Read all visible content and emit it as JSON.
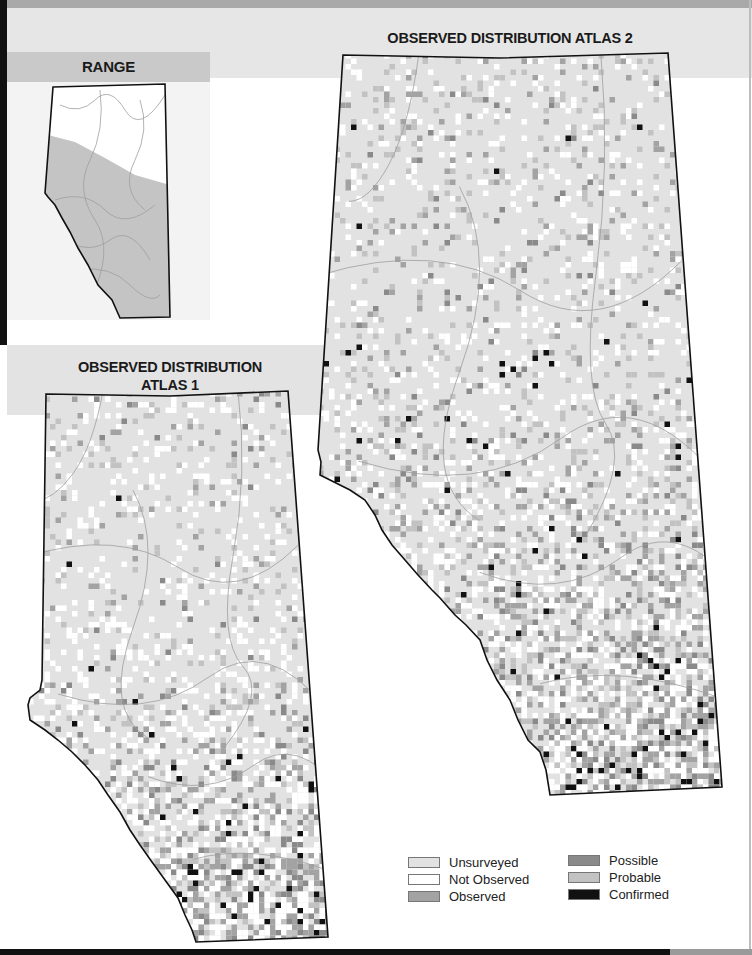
{
  "titles": {
    "range": "RANGE",
    "atlas2": "OBSERVED DISTRIBUTION ATLAS 2",
    "atlas1_line1": "OBSERVED DISTRIBUTION",
    "atlas1_line2": "ATLAS 1"
  },
  "legend": {
    "items": [
      {
        "label": "Unsurveyed",
        "color": "#e2e2e2"
      },
      {
        "label": "Not Observed",
        "color": "#ffffff"
      },
      {
        "label": "Observed",
        "color": "#a3a3a3"
      },
      {
        "label": "Possible",
        "color": "#8a8a8a"
      },
      {
        "label": "Probable",
        "color": "#c2c2c2"
      },
      {
        "label": "Confirmed",
        "color": "#111111"
      }
    ]
  },
  "colors": {
    "unsurveyed": "#e2e2e2",
    "not_observed": "#ffffff",
    "observed": "#a3a3a3",
    "possible": "#8a8a8a",
    "probable": "#c2c2c2",
    "confirmed": "#111111",
    "range_fill": "#c4c4c4",
    "outline": "#111111",
    "river": "#9e9e9e"
  },
  "maps": {
    "range": {
      "outline": [
        [
          53,
          87
        ],
        [
          165,
          84
        ],
        [
          170,
          317
        ],
        [
          120,
          318
        ],
        [
          112,
          300
        ],
        [
          98,
          285
        ],
        [
          88,
          265
        ],
        [
          78,
          248
        ],
        [
          70,
          232
        ],
        [
          62,
          218
        ],
        [
          55,
          205
        ],
        [
          48,
          197
        ],
        [
          45,
          193
        ]
      ],
      "range_boundary": [
        [
          48,
          135
        ],
        [
          75,
          142
        ],
        [
          105,
          158
        ],
        [
          135,
          175
        ],
        [
          170,
          185
        ]
      ]
    },
    "atlas2": {
      "outline": [
        [
          343,
          55
        ],
        [
          500,
          58
        ],
        [
          668,
          53
        ],
        [
          722,
          787
        ],
        [
          550,
          795
        ],
        [
          546,
          770
        ],
        [
          540,
          752
        ],
        [
          528,
          740
        ],
        [
          518,
          720
        ],
        [
          510,
          700
        ],
        [
          497,
          680
        ],
        [
          487,
          660
        ],
        [
          480,
          640
        ],
        [
          466,
          625
        ],
        [
          455,
          615
        ],
        [
          440,
          598
        ],
        [
          432,
          590
        ],
        [
          418,
          575
        ],
        [
          405,
          560
        ],
        [
          392,
          545
        ],
        [
          382,
          530
        ],
        [
          375,
          515
        ],
        [
          365,
          500
        ],
        [
          350,
          490
        ],
        [
          330,
          480
        ],
        [
          320,
          475
        ],
        [
          321,
          462
        ],
        [
          318,
          450
        ]
      ],
      "density_seed": 7
    },
    "atlas1": {
      "outline": [
        [
          46,
          394
        ],
        [
          170,
          396
        ],
        [
          288,
          391
        ],
        [
          328,
          937
        ],
        [
          196,
          942
        ],
        [
          192,
          930
        ],
        [
          185,
          915
        ],
        [
          178,
          898
        ],
        [
          165,
          880
        ],
        [
          152,
          862
        ],
        [
          140,
          845
        ],
        [
          130,
          830
        ],
        [
          120,
          812
        ],
        [
          108,
          795
        ],
        [
          98,
          780
        ],
        [
          85,
          765
        ],
        [
          72,
          752
        ],
        [
          58,
          740
        ],
        [
          45,
          730
        ],
        [
          30,
          720
        ],
        [
          28,
          705
        ],
        [
          30,
          698
        ],
        [
          40,
          690
        ],
        [
          42,
          680
        ]
      ],
      "density_seed": 3
    }
  }
}
